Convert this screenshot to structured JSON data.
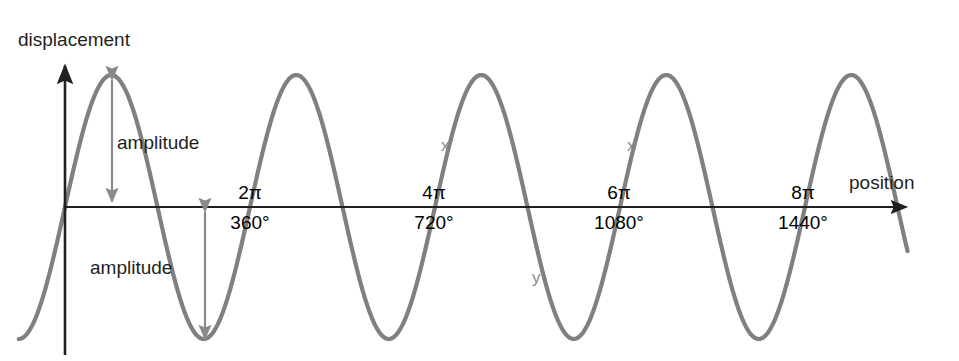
{
  "figure": {
    "axes": {
      "y_axis_label": "displacement",
      "x_axis_label": "position"
    },
    "annotations": {
      "amplitude_top": "amplitude",
      "amplitude_bottom": "amplitude",
      "point_x_1": "x",
      "point_x_2": "x",
      "point_y_1": "y"
    },
    "ticks": [
      {
        "radians": "2π",
        "degrees": "360°"
      },
      {
        "radians": "4π",
        "degrees": "720°"
      },
      {
        "radians": "6π",
        "degrees": "1080°"
      },
      {
        "radians": "8π",
        "degrees": "1440°"
      }
    ],
    "colors": {
      "wave": "#808080",
      "axis": "#231f20",
      "text": "#231f20",
      "marker": "#8a8a8a",
      "arrow": "#8a8a8a",
      "background": "#ffffff"
    }
  },
  "chart_data": {
    "type": "line",
    "title": "",
    "xlabel": "position",
    "ylabel": "displacement",
    "grid": false,
    "legend": false,
    "xlim": [
      0,
      1620
    ],
    "ylim": [
      -1,
      1
    ],
    "x_tick_values": [
      360,
      720,
      1080,
      1440
    ],
    "x_tick_labels_radians": [
      "2π",
      "4π",
      "6π",
      "8π"
    ],
    "x_tick_labels_degrees": [
      "360°",
      "720°",
      "1080°",
      "1440°"
    ],
    "series": [
      {
        "name": "displacement",
        "function": "sin",
        "amplitude": 1,
        "period_degrees": 360,
        "phase_degrees": 0,
        "x_start_degrees": -90,
        "x_end_degrees": 1640
      }
    ],
    "peaks_degrees": [
      90,
      450,
      810,
      1170
    ],
    "troughs_degrees": [
      270,
      630,
      990,
      1350
    ],
    "zero_crossings_degrees": [
      0,
      180,
      360,
      540,
      720,
      900,
      1080,
      1260,
      1440
    ],
    "annotations": [
      {
        "label": "amplitude",
        "from_degrees": 90,
        "from_value": 1,
        "to_value": 0
      },
      {
        "label": "amplitude",
        "from_degrees": 270,
        "from_value": 0,
        "to_value": -1
      },
      {
        "label": "x",
        "x_degrees": 746,
        "y_value": 0.48
      },
      {
        "label": "y",
        "x_degrees": 924,
        "y_value": -0.53
      },
      {
        "label": "x",
        "x_degrees": 1108,
        "y_value": 0.47
      }
    ]
  }
}
